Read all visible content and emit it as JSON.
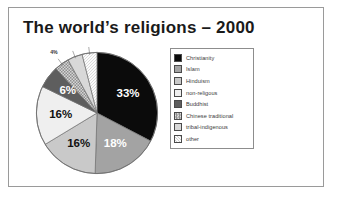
{
  "title": "The world’s religions – 2000",
  "frame": {
    "border_color": "#9a9a9a"
  },
  "legend": {
    "border_color": "#8d8d8d",
    "items": [
      {
        "label": "Christianity",
        "color": "#0b0b0b",
        "pattern": "solid"
      },
      {
        "label": "Islam",
        "color": "#a3a3a3",
        "pattern": "solid"
      },
      {
        "label": "Hinduism",
        "color": "#c9c9c9",
        "pattern": "solid"
      },
      {
        "label": "non-religous",
        "color": "#efefef",
        "pattern": "solid"
      },
      {
        "label": "Buddhist",
        "color": "#5e5e5e",
        "pattern": "solid"
      },
      {
        "label": "Chinese traditional",
        "color": "#b5b5b5",
        "pattern": "checker"
      },
      {
        "label": "tribal-indigenous",
        "color": "#d8d8d8",
        "pattern": "solid"
      },
      {
        "label": "other",
        "color": "#fbfbfb",
        "pattern": "hatch"
      }
    ]
  },
  "chart_data": {
    "type": "pie",
    "title": "The world’s religions – 2000",
    "categories": [
      "Christianity",
      "Islam",
      "Hinduism",
      "non-religous",
      "Buddhist",
      "Chinese traditional",
      "tribal-indigenous",
      "other"
    ],
    "values": [
      33,
      18,
      16,
      16,
      6,
      4,
      4,
      4
    ],
    "value_labels": [
      "33%",
      "18%",
      "16%",
      "16%",
      "6%",
      "4%",
      "4%",
      "4%"
    ],
    "colors": [
      "#0b0b0b",
      "#a3a3a3",
      "#c9c9c9",
      "#efefef",
      "#5e5e5e",
      "#b5b5b5",
      "#d8d8d8",
      "#fbfbfb"
    ],
    "label_text_colors": [
      "#ffffff",
      "#ffffff",
      "#111111",
      "#111111",
      "#ffffff",
      "#333333",
      "#333333",
      "#333333"
    ],
    "unit": "%",
    "start_angle_deg": 0,
    "direction": "clockwise",
    "legend_position": "right",
    "grid": false,
    "xlabel": "",
    "ylabel": ""
  }
}
